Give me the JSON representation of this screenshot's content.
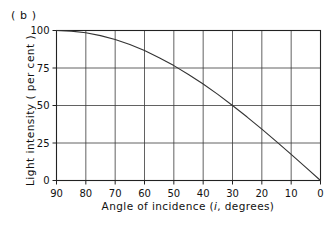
{
  "figure": {
    "panel_label": "( b )"
  },
  "chart_data": {
    "type": "line",
    "title": "",
    "xlabel": "Angle of incidence ( i, degrees)",
    "xlabel_prefix": "Angle of incidence (",
    "xlabel_symbol": "i",
    "xlabel_suffix": ", degrees)",
    "ylabel": "Light intensity ( per cent )",
    "xlim": [
      90,
      0
    ],
    "ylim": [
      0,
      100
    ],
    "x_ticks": [
      90,
      80,
      70,
      60,
      50,
      40,
      30,
      20,
      10,
      0
    ],
    "x_tick_labels": [
      "90",
      "80",
      "70",
      "60",
      "50",
      "40",
      "30",
      "20",
      "10",
      "0"
    ],
    "y_ticks": [
      0,
      25,
      50,
      75,
      100
    ],
    "y_tick_labels": [
      "0",
      "25",
      "50",
      "75",
      "100"
    ],
    "grid": true,
    "x_axis_inverted": true,
    "legend": "none",
    "series": [
      {
        "name": "Light intensity vs angle of incidence",
        "color": "#333333",
        "x": [
          90,
          85,
          80,
          75,
          70,
          65,
          60,
          55,
          50,
          45,
          40,
          35,
          30,
          25,
          20,
          15,
          10,
          5,
          0
        ],
        "values": [
          100.0,
          99.6,
          98.5,
          96.6,
          94.0,
          90.6,
          86.6,
          81.9,
          76.6,
          70.7,
          64.3,
          57.4,
          50.0,
          42.3,
          34.2,
          25.9,
          17.4,
          8.7,
          0.0
        ]
      }
    ],
    "annotations": []
  }
}
